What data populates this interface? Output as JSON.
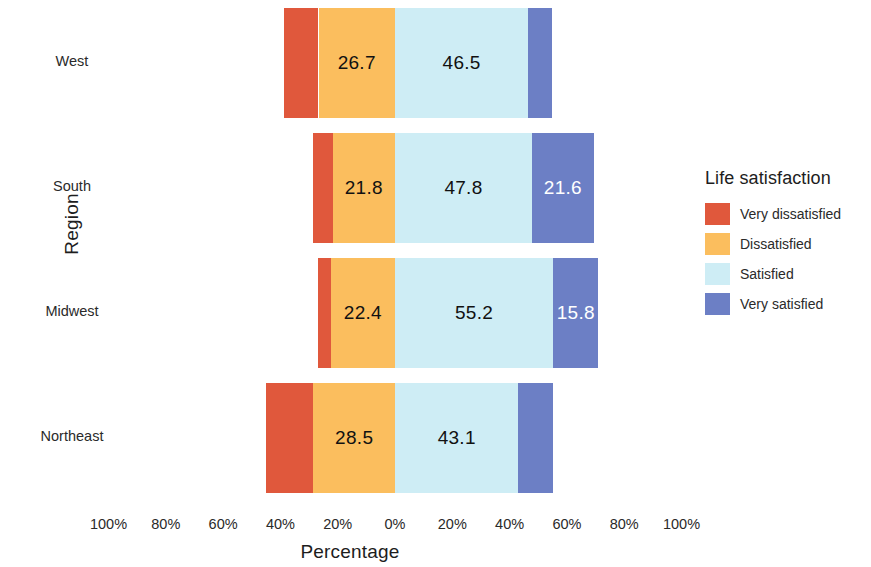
{
  "chart_data": {
    "type": "bar",
    "subtype": "diverging-stacked-horizontal",
    "title": "",
    "xlabel": "Percentage",
    "ylabel": "Region",
    "categories": [
      "Northeast",
      "Midwest",
      "South",
      "West"
    ],
    "category_order_top_to_bottom": [
      "West",
      "South",
      "Midwest",
      "Northeast"
    ],
    "legend_title": "Life satisfaction",
    "legend_position": "right",
    "grid": false,
    "xlim": [
      -100,
      100
    ],
    "xticks": [
      -100,
      -80,
      -60,
      -40,
      -20,
      0,
      20,
      40,
      60,
      80,
      100
    ],
    "xticklabels": [
      "100%",
      "80%",
      "60%",
      "40%",
      "20%",
      "0%",
      "20%",
      "40%",
      "60%",
      "80%",
      "100%"
    ],
    "divergence_point": "between Dissatisfied and Satisfied",
    "series": [
      {
        "name": "Very dissatisfied",
        "color": "#E0583C",
        "direction": "negative",
        "values": [
          16.5,
          4.5,
          6.8,
          12.0
        ]
      },
      {
        "name": "Dissatisfied",
        "color": "#FBBE5E",
        "direction": "negative",
        "values": [
          28.5,
          22.4,
          21.8,
          26.7
        ]
      },
      {
        "name": "Satisfied",
        "color": "#CEEDF5",
        "direction": "positive",
        "values": [
          43.1,
          55.2,
          47.8,
          46.5
        ]
      },
      {
        "name": "Very satisfied",
        "color": "#6C7FC5",
        "direction": "positive",
        "values": [
          11.9,
          15.8,
          21.6,
          8.4
        ]
      }
    ],
    "data_labels": [
      {
        "category": "West",
        "series": "Dissatisfied",
        "text": "26.7"
      },
      {
        "category": "West",
        "series": "Satisfied",
        "text": "46.5"
      },
      {
        "category": "South",
        "series": "Dissatisfied",
        "text": "21.8"
      },
      {
        "category": "South",
        "series": "Satisfied",
        "text": "47.8"
      },
      {
        "category": "South",
        "series": "Very satisfied",
        "text": "21.6"
      },
      {
        "category": "Midwest",
        "series": "Dissatisfied",
        "text": "22.4"
      },
      {
        "category": "Midwest",
        "series": "Satisfied",
        "text": "55.2"
      },
      {
        "category": "Midwest",
        "series": "Very satisfied",
        "text": "15.8"
      },
      {
        "category": "Northeast",
        "series": "Dissatisfied",
        "text": "28.5"
      },
      {
        "category": "Northeast",
        "series": "Satisfied",
        "text": "43.1"
      }
    ]
  },
  "axes": {
    "y_title": "Region",
    "x_title": "Percentage",
    "y_tick_labels": [
      "West",
      "South",
      "Midwest",
      "Northeast"
    ],
    "x_tick_labels": [
      "100%",
      "80%",
      "60%",
      "40%",
      "20%",
      "0%",
      "20%",
      "40%",
      "60%",
      "80%",
      "100%"
    ]
  },
  "legend": {
    "title": "Life satisfaction",
    "items": [
      {
        "label": "Very dissatisfied",
        "color": "#E0583C"
      },
      {
        "label": "Dissatisfied",
        "color": "#FBBE5E"
      },
      {
        "label": "Satisfied",
        "color": "#CEEDF5"
      },
      {
        "label": "Very satisfied",
        "color": "#6C7FC5"
      }
    ]
  },
  "layout": {
    "zero_x_px": 395,
    "px_per_percent": 2.865,
    "bar_height_px": 110,
    "row_top_px": [
      8,
      133,
      258,
      383
    ],
    "x_tick_positions_px": [
      108.5,
      165.8,
      223.1,
      280.4,
      337.7,
      395,
      452.3,
      509.6,
      566.9,
      624.2,
      681.5
    ],
    "y_tick_center_px": [
      63,
      188,
      313,
      438
    ]
  }
}
